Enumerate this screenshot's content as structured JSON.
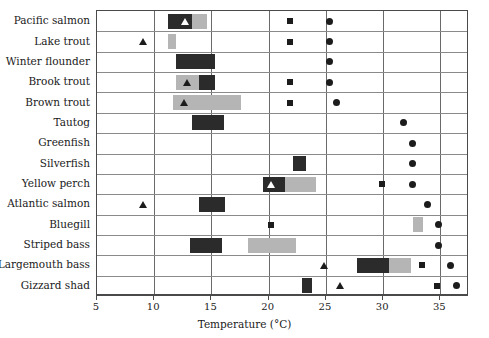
{
  "chart_data": {
    "type": "bar",
    "title": "",
    "xlabel": "Temperature (°C)",
    "ylabel": "",
    "xlim": [
      5,
      37.5
    ],
    "xticks": [
      5,
      10,
      15,
      20,
      25,
      30,
      35
    ],
    "xtick_labels": [
      "5",
      "10",
      "15",
      "20",
      "25",
      "30",
      "35"
    ],
    "grid": true,
    "legend": "none",
    "categories": [
      "Pacific salmon",
      "Lake trout",
      "Winter flounder",
      "Brook trout",
      "Brown trout",
      "Tautog",
      "Greenfish",
      "Silverfish",
      "Yellow perch",
      "Atlantic salmon",
      "Bluegill",
      "Striped bass",
      "Largemouth bass",
      "Gizzard shad"
    ],
    "series": [
      {
        "name": "dark band",
        "type": "range-bar",
        "color": "#2b2b2b",
        "values": [
          [
            11.2,
            13.3
          ],
          null,
          [
            11.9,
            15.3
          ],
          [
            13.9,
            15.3
          ],
          null,
          [
            13.3,
            16.1
          ],
          null,
          [
            22.1,
            23.3
          ],
          [
            19.5,
            21.4
          ],
          [
            13.9,
            16.2
          ],
          null,
          [
            13.1,
            15.9
          ],
          [
            27.7,
            30.5
          ],
          [
            22.9,
            23.8
          ]
        ]
      },
      {
        "name": "light band",
        "type": "range-bar",
        "color": "#b5b5b5",
        "values": [
          [
            13.3,
            14.6
          ],
          [
            11.2,
            11.9
          ],
          null,
          [
            11.9,
            13.9
          ],
          [
            11.6,
            17.6
          ],
          null,
          null,
          null,
          [
            21.4,
            24.1
          ],
          null,
          [
            32.6,
            33.5
          ],
          [
            18.2,
            22.4
          ],
          [
            30.5,
            32.4
          ],
          null
        ]
      },
      {
        "name": "triangle marker",
        "type": "point",
        "marker": "triangle",
        "color": "#1c1c1c",
        "values": [
          12.7,
          9.0,
          null,
          12.9,
          12.6,
          null,
          null,
          null,
          20.2,
          9.0,
          null,
          null,
          24.8,
          26.2
        ]
      },
      {
        "name": "square marker",
        "type": "point",
        "marker": "square",
        "color": "#1c1c1c",
        "values": [
          21.9,
          21.9,
          null,
          21.9,
          21.9,
          null,
          null,
          null,
          29.9,
          null,
          20.2,
          null,
          33.4,
          34.7
        ]
      },
      {
        "name": "circle marker",
        "type": "point",
        "marker": "circle",
        "color": "#1c1c1c",
        "values": [
          25.3,
          25.3,
          25.3,
          25.3,
          25.9,
          31.8,
          32.6,
          32.6,
          32.6,
          33.9,
          34.8,
          34.8,
          35.9,
          36.4
        ]
      }
    ]
  }
}
